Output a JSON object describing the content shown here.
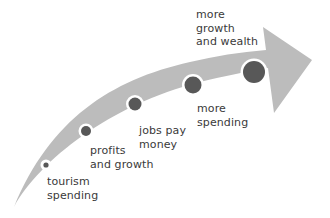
{
  "diagram": {
    "type": "curved-arrow-process",
    "colors": {
      "arrow": "#bcbcbc",
      "node_fill": "#585858",
      "node_ring": "#ffffff",
      "text": "#3a3a3a",
      "background": "#ffffff"
    },
    "steps": [
      {
        "id": "step-1",
        "lines": [
          "tourism",
          "spending"
        ]
      },
      {
        "id": "step-2",
        "lines": [
          "profits",
          "and growth"
        ]
      },
      {
        "id": "step-3",
        "lines": [
          "jobs pay",
          "money"
        ]
      },
      {
        "id": "step-4",
        "lines": [
          "more",
          "spending"
        ]
      },
      {
        "id": "step-5",
        "lines": [
          "more",
          "growth",
          "and wealth"
        ]
      }
    ]
  }
}
